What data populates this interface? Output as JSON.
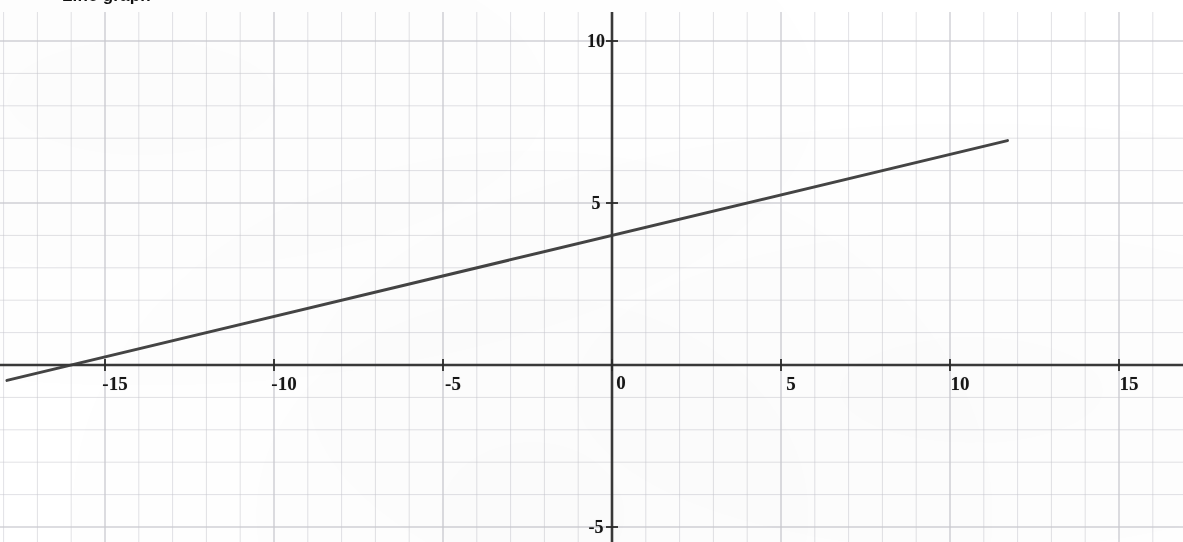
{
  "page": {
    "title_fragment": "Line graph",
    "background_color": "#ffffff",
    "grid_color": "#c9c9cf",
    "axis_color": "#2a2a2a",
    "line_color": "#3a3a3a",
    "width": 1183,
    "height": 542
  },
  "chart_data": {
    "type": "line",
    "title": "Line graph",
    "xlabel": "",
    "ylabel": "",
    "xlim": [
      -18.1,
      16.9
    ],
    "ylim": [
      -5.4,
      10.9
    ],
    "grid": true,
    "minor_grid_step": 1,
    "major_tick_step": 5,
    "legend": null,
    "legend_position": "none",
    "xticks": [
      -15,
      -10,
      -5,
      0,
      5,
      10,
      15
    ],
    "xtick_labels": [
      "-15",
      "-10",
      "-5",
      "0",
      "5",
      "10",
      "15"
    ],
    "yticks": [
      -5,
      5,
      10
    ],
    "ytick_labels": [
      "-5",
      "5",
      "10"
    ],
    "origin_label": "0",
    "series": [
      {
        "name": "y = 0.25x + 4",
        "slope": 0.25,
        "intercept": 4,
        "x_intercept": -16,
        "y_intercept": 4,
        "x": [
          -17.9,
          11.7
        ],
        "y": [
          -0.475,
          6.925
        ],
        "points": [
          {
            "x": -16,
            "y": 0
          },
          {
            "x": 0,
            "y": 4
          },
          {
            "x": 11.7,
            "y": 6.93
          }
        ]
      }
    ]
  },
  "axes": {
    "x_axis_name": "x-axis",
    "y_axis_name": "y-axis",
    "origin_x_px": 612,
    "origin_y_px": 365,
    "px_per_unit_x": 33.8,
    "px_per_unit_y": 32.4
  }
}
